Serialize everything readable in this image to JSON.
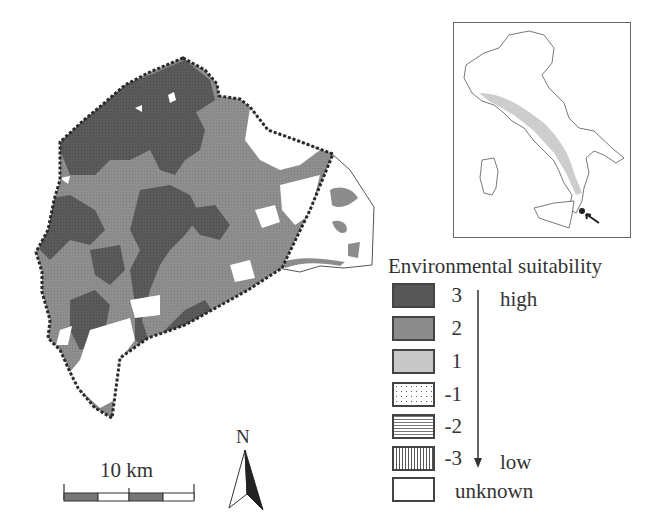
{
  "figure": {
    "main_map": {
      "description": "Study area environmental suitability map with dashed boundary",
      "colors": {
        "class_3": "#575757",
        "class_2": "#8c8c8c",
        "class_1": "#c8c8c8",
        "unknown": "#ffffff",
        "boundary": "#333333"
      }
    },
    "inset_map": {
      "description": "Italy locator map with study area marked",
      "locator_arrow": "arrow-pointing-to-study-area"
    },
    "legend": {
      "title": "Environmental suitability",
      "high_label": "high",
      "low_label": "low",
      "items": [
        {
          "value": "3",
          "pattern": "solid-dark",
          "color": "#575757"
        },
        {
          "value": "2",
          "pattern": "solid-medium",
          "color": "#8c8c8c"
        },
        {
          "value": "1",
          "pattern": "solid-light",
          "color": "#c8c8c8"
        },
        {
          "value": "-1",
          "pattern": "dotted",
          "color": "#ffffff"
        },
        {
          "value": "-2",
          "pattern": "horizontal-lines",
          "color": "#ffffff"
        },
        {
          "value": "-3",
          "pattern": "vertical-lines",
          "color": "#ffffff"
        },
        {
          "value": "",
          "label": "unknown",
          "pattern": "empty",
          "color": "#ffffff"
        }
      ],
      "unknown_label": "unknown"
    },
    "scale_bar": {
      "label": "10 km"
    },
    "north_arrow": {
      "label": "N"
    }
  }
}
